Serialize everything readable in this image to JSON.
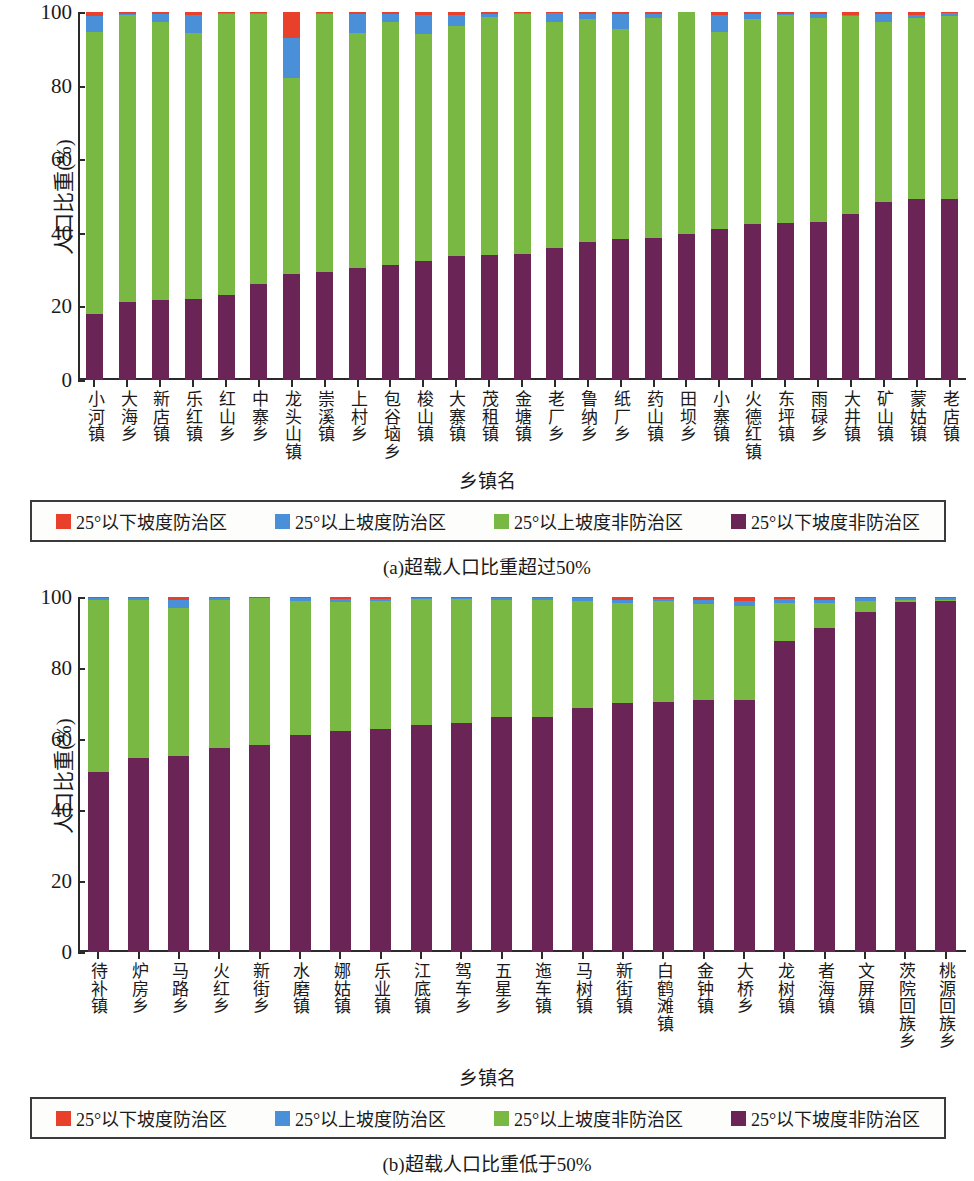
{
  "figure": {
    "panels": [
      {
        "id": "panel-a",
        "caption": "(a)超载人口比重超过50%",
        "ylabel": "人口比重(%)",
        "xlabel": "乡镇名",
        "yticks": [
          "0",
          "20",
          "40",
          "60",
          "80",
          "100"
        ]
      },
      {
        "id": "panel-b",
        "caption": "(b)超载人口比重低于50%",
        "ylabel": "人口比重(%)",
        "xlabel": "乡镇名",
        "yticks": [
          "0",
          "20",
          "40",
          "60",
          "80",
          "100"
        ]
      }
    ],
    "legend": {
      "items": [
        {
          "label": "25°以下坡度防治区",
          "color": "#e8402a"
        },
        {
          "label": "25°以上坡度防治区",
          "color": "#4a90d9"
        },
        {
          "label": "25°以上坡度非防治区",
          "color": "#78b843"
        },
        {
          "label": "25°以下坡度非防治区",
          "color": "#6b2456"
        }
      ]
    }
  },
  "chart_data": [
    {
      "type": "bar",
      "stacked": true,
      "normalized_to_100": true,
      "title": "(a)超载人口比重超过50%",
      "xlabel": "乡镇名",
      "ylabel": "人口比重(%)",
      "ylim": [
        0,
        100
      ],
      "yticks": [
        0,
        20,
        40,
        60,
        80,
        100
      ],
      "grid": false,
      "legend_position": "below-plot",
      "categories": [
        "小河镇",
        "大海乡",
        "新店镇",
        "乐红镇",
        "红山乡",
        "中寨乡",
        "龙头山镇",
        "崇溪镇",
        "上村乡",
        "包谷垴乡",
        "梭山镇",
        "大寨镇",
        "茂租镇",
        "金塘镇",
        "老厂乡",
        "鲁纳乡",
        "纸厂乡",
        "药山镇",
        "田坝乡",
        "小寨镇",
        "火德红镇",
        "东坪镇",
        "雨碌乡",
        "大井镇",
        "矿山镇",
        "蒙姑镇",
        "老店镇"
      ],
      "series": [
        {
          "name": "25°以下坡度非防治区",
          "color": "#6b2456",
          "values": [
            18.0,
            21.2,
            21.8,
            22.0,
            23.2,
            26.0,
            28.8,
            29.4,
            30.5,
            31.2,
            32.4,
            33.6,
            34.0,
            34.2,
            35.8,
            37.6,
            38.2,
            38.5,
            39.6,
            41.0,
            42.4,
            42.6,
            43.0,
            45.2,
            48.4,
            49.2,
            49.3
          ]
        },
        {
          "name": "25°以上坡度非防治区",
          "color": "#78b843",
          "values": [
            76.6,
            78.0,
            75.6,
            72.4,
            76.2,
            73.4,
            53.4,
            70.0,
            63.7,
            66.1,
            61.6,
            62.5,
            64.6,
            65.3,
            61.6,
            60.5,
            57.3,
            60.0,
            60.4,
            53.7,
            55.8,
            56.6,
            55.4,
            53.6,
            49.0,
            49.1,
            49.5
          ]
        },
        {
          "name": "25°以上坡度防治区",
          "color": "#4a90d9",
          "values": [
            4.3,
            0.2,
            2.0,
            4.8,
            0.2,
            0.2,
            10.8,
            0.2,
            5.4,
            2.2,
            5.2,
            3.2,
            0.8,
            0.2,
            2.2,
            1.4,
            3.9,
            1.0,
            0.0,
            4.6,
            1.2,
            0.2,
            1.0,
            0.4,
            2.0,
            1.0,
            0.8
          ]
        },
        {
          "name": "25°以下坡度防治区",
          "color": "#e8402a",
          "values": [
            1.1,
            0.6,
            0.6,
            0.8,
            0.4,
            0.4,
            7.0,
            0.4,
            0.4,
            0.5,
            0.8,
            0.7,
            0.6,
            0.3,
            0.4,
            0.5,
            0.6,
            0.5,
            0.0,
            0.7,
            0.6,
            0.6,
            0.6,
            0.8,
            0.6,
            0.7,
            0.4
          ]
        }
      ]
    },
    {
      "type": "bar",
      "stacked": true,
      "normalized_to_100": true,
      "title": "(b)超载人口比重低于50%",
      "xlabel": "乡镇名",
      "ylabel": "人口比重(%)",
      "ylim": [
        0,
        100
      ],
      "yticks": [
        0,
        20,
        40,
        60,
        80,
        100
      ],
      "grid": false,
      "legend_position": "below-plot",
      "categories": [
        "待补镇",
        "炉房乡",
        "马路乡",
        "火红乡",
        "新街乡",
        "水磨镇",
        "娜姑镇",
        "乐业镇",
        "江底镇",
        "驾车乡",
        "五星乡",
        "迤车镇",
        "马树镇",
        "新街镇",
        "白鹤滩镇",
        "金钟镇",
        "大桥乡",
        "龙树镇",
        "者海镇",
        "文屏镇",
        "茨院回族乡",
        "桃源回族乡"
      ],
      "series": [
        {
          "name": "25°以下坡度非防治区",
          "color": "#6b2456",
          "values": [
            50.6,
            54.6,
            55.2,
            57.6,
            58.2,
            61.2,
            62.2,
            62.8,
            64.0,
            64.6,
            66.2,
            66.3,
            68.6,
            70.2,
            70.3,
            71.0,
            71.0,
            87.6,
            91.4,
            95.8,
            98.6,
            98.8
          ]
        },
        {
          "name": "25°以上坡度非防治区",
          "color": "#78b843",
          "values": [
            48.6,
            44.6,
            41.8,
            41.6,
            41.6,
            37.8,
            36.4,
            36.0,
            35.4,
            34.8,
            33.0,
            33.0,
            30.4,
            28.2,
            28.5,
            27.0,
            26.6,
            10.6,
            6.9,
            3.0,
            0.6,
            0.5
          ]
        },
        {
          "name": "25°以上坡度防治区",
          "color": "#4a90d9",
          "values": [
            0.4,
            0.4,
            2.2,
            0.4,
            0.0,
            0.6,
            0.8,
            0.6,
            0.3,
            0.3,
            0.4,
            0.4,
            0.6,
            0.7,
            0.6,
            1.2,
            1.4,
            1.2,
            1.0,
            0.8,
            0.5,
            0.4
          ]
        },
        {
          "name": "25°以下坡度防治区",
          "color": "#e8402a",
          "values": [
            0.4,
            0.4,
            0.8,
            0.4,
            0.2,
            0.4,
            0.6,
            0.6,
            0.3,
            0.3,
            0.4,
            0.3,
            0.4,
            0.9,
            0.6,
            0.8,
            1.0,
            0.6,
            0.7,
            0.4,
            0.3,
            0.3
          ]
        }
      ]
    }
  ]
}
